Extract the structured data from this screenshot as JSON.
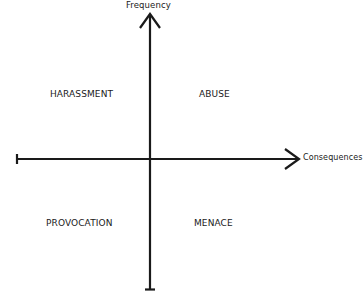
{
  "diagram": {
    "type": "quadrant",
    "axes": {
      "y_label": "Frequency",
      "x_label": "Consequences"
    },
    "quadrants": {
      "top_left": "HARASSMENT",
      "top_right": "ABUSE",
      "bottom_left": "PROVOCATION",
      "bottom_right": "MENACE"
    },
    "colors": {
      "line": "#1a1a1a",
      "text": "#1a1a1a",
      "background": "#ffffff"
    }
  }
}
